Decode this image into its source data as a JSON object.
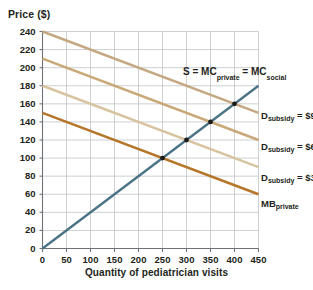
{
  "chart_data": {
    "type": "line",
    "title": "",
    "xlabel": "Quantity of pediatrician visits",
    "ylabel": "Price ($)",
    "xlim": [
      0,
      450
    ],
    "ylim": [
      0,
      240
    ],
    "xticks": [
      0,
      50,
      100,
      150,
      200,
      250,
      300,
      350,
      400,
      450
    ],
    "yticks": [
      0,
      20,
      40,
      60,
      80,
      100,
      120,
      140,
      160,
      180,
      200,
      220,
      240
    ],
    "grid": true,
    "legend_position": "right-inline-labels",
    "series": [
      {
        "name": "S = MC_private = MC_social",
        "label": "S = MC",
        "label_sub1": "private",
        "label_mid": " = MC",
        "label_sub2": "social",
        "color": "#4a7285",
        "type": "supply",
        "x": [
          0,
          450
        ],
        "y": [
          0,
          180
        ],
        "slope": 0.4,
        "intercept": 0
      },
      {
        "name": "D_subsidy = $90",
        "label_main": "D",
        "label_sub": "subsidy",
        "label_value": " = $90",
        "color": "#c4a882",
        "type": "demand",
        "x": [
          0,
          450
        ],
        "y": [
          240,
          150
        ],
        "slope": -0.2,
        "intercept": 240
      },
      {
        "name": "D_subsidy = $60",
        "label_main": "D",
        "label_sub": "subsidy",
        "label_value": " = $60",
        "color": "#c9a877",
        "type": "demand",
        "x": [
          0,
          450
        ],
        "y": [
          210,
          120
        ],
        "slope": -0.2,
        "intercept": 210
      },
      {
        "name": "D_subsidy = $30",
        "label_main": "D",
        "label_sub": "subsidy",
        "label_value": " = $30",
        "color": "#d8c4a0",
        "type": "demand",
        "x": [
          0,
          450
        ],
        "y": [
          180,
          90
        ],
        "slope": -0.2,
        "intercept": 180
      },
      {
        "name": "MB_private",
        "label_main": "MB",
        "label_sub": "private",
        "label_value": "",
        "color": "#b5762a",
        "type": "demand",
        "x": [
          0,
          450
        ],
        "y": [
          150,
          60
        ],
        "slope": -0.2,
        "intercept": 150
      }
    ],
    "equilibrium_points": [
      {
        "x": 250,
        "y": 100,
        "label": "MB_private equilibrium"
      },
      {
        "x": 300,
        "y": 120,
        "label": "D_subsidy $30 equilibrium"
      },
      {
        "x": 350,
        "y": 140,
        "label": "D_subsidy $60 equilibrium"
      },
      {
        "x": 400,
        "y": 160,
        "label": "D_subsidy $90 equilibrium"
      }
    ],
    "colors": {
      "supply": "#4a7285",
      "demand_90": "#c4a882",
      "demand_60": "#c9a877",
      "demand_30": "#d8c4a0",
      "mb_private": "#b5762a",
      "grid": "#b9bcc0",
      "axis": "#6d7278",
      "text": "#231f20"
    }
  },
  "axis": {
    "y_title": "Price ($)",
    "x_title": "Quantity of pediatrician visits",
    "y_tick_labels": [
      "240",
      "220",
      "200",
      "180",
      "160",
      "140",
      "120",
      "100",
      "80",
      "60",
      "40",
      "20",
      "0"
    ],
    "x_tick_labels": [
      "0",
      "50",
      "100",
      "150",
      "200",
      "250",
      "300",
      "350",
      "400",
      "450"
    ]
  },
  "labels": {
    "supply_prefix": "S = MC",
    "supply_sub1": "private",
    "supply_mid": " = MC",
    "supply_sub2": "social",
    "d90_main": "D",
    "d90_sub": "subsidy",
    "d90_val": " = $90",
    "d60_main": "D",
    "d60_sub": "subsidy",
    "d60_val": " = $60",
    "d30_main": "D",
    "d30_sub": "subsidy",
    "d30_val": " = $30",
    "mb_main": "MB",
    "mb_sub": "private"
  }
}
